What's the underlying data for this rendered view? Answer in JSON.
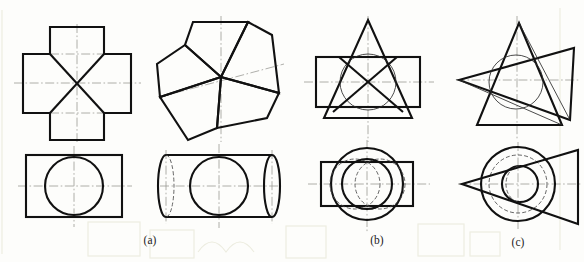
{
  "figure": {
    "background_color": "#fdfdfb",
    "line_color": "#111111",
    "center_line_color": "#9a9a96",
    "hidden_line_color": "#4a4a4a",
    "captions": [
      {
        "id": "a",
        "label": "(a)",
        "x": 150,
        "y": 244
      },
      {
        "id": "b",
        "label": "(b)",
        "x": 377,
        "y": 244
      },
      {
        "id": "c",
        "label": "(c)",
        "x": 518,
        "y": 246
      }
    ],
    "groups": [
      {
        "id": "a",
        "caption": "(a)",
        "top_views": [
          {
            "name": "cross-with-x-front-view",
            "shape": "cross",
            "description": "Plus/cross outline with diagonal X lines meeting at center",
            "center": [
              77,
              83
            ],
            "half_width": 54,
            "half_height": 56,
            "arm_half": 27
          },
          {
            "name": "pinwheel-front-view",
            "shape": "pinwheel",
            "description": "Five rotated quadrilateral blades radiating from a common center",
            "center": [
              221,
              77
            ],
            "blades": 5,
            "radius": 58
          }
        ],
        "bottom_views": [
          {
            "name": "rectangle-with-circle-top-view",
            "shape": "rectangle-circle",
            "description": "Rectangle with inscribed circle",
            "center": [
              74,
              186
            ],
            "rect_half_width": 48,
            "rect_half_height": 31,
            "circle_radius": 29
          },
          {
            "name": "cylinder-with-circle-top-view",
            "shape": "cylinder-circle",
            "description": "Cylinder drawn as rectangle with end ellipses plus central circle",
            "center": [
              219,
              186
            ],
            "rect_half_width": 53,
            "rect_half_height": 31,
            "ellipse_rx": 8,
            "circle_radius": 29
          }
        ]
      },
      {
        "id": "b",
        "caption": "(b)",
        "top_views": [
          {
            "name": "triangle-rectangle-front-view",
            "shape": "triangle-rectangle-circle",
            "description": "Isosceles triangle overlapping a rectangle, X diagonals, thin circle",
            "center": [
              368,
              82
            ],
            "triangle_half_base": 44,
            "triangle_height": 98,
            "rect_half_width": 52,
            "rect_half_height": 25,
            "circle_radius": 28
          }
        ],
        "bottom_views": [
          {
            "name": "circle-rectangle-ellipses-top-view",
            "shape": "circle-rectangle-ellipses",
            "description": "Large circle with rectangle and two overlapping offset circles",
            "center": [
              367,
              184
            ],
            "circle_radius": 36,
            "rect_half_width": 46,
            "rect_half_height": 22,
            "lens_radius": 24,
            "lens_offset": 13
          }
        ]
      },
      {
        "id": "c",
        "caption": "(c)",
        "top_views": [
          {
            "name": "two-triangles-front-view",
            "shape": "two-triangles-circle",
            "description": "Upright triangle overlapped by a left-pointing tilted triangle with thin circle",
            "center": [
              515,
              80
            ],
            "circle_radius": 27
          }
        ],
        "bottom_views": [
          {
            "name": "triangle-circles-top-view",
            "shape": "triangle-circles",
            "description": "Left-pointing triangle with concentric circle, inner circle and hidden dashed circle",
            "center": [
              518,
              184
            ],
            "outer_radius": 37,
            "dashed_radius": 29,
            "inner_radius": 18
          }
        ]
      }
    ]
  }
}
